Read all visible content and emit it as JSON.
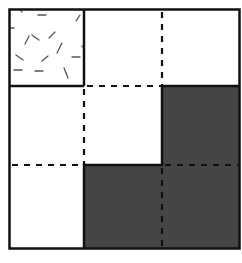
{
  "diagram": {
    "rows": 3,
    "cols": 3,
    "colors": {
      "background": "#ffffff",
      "line": "#111111",
      "shaded": "#454545",
      "texture": "#555555"
    },
    "cells": [
      {
        "row": 0,
        "col": 0,
        "fill": "textured"
      },
      {
        "row": 0,
        "col": 1,
        "fill": "white"
      },
      {
        "row": 0,
        "col": 2,
        "fill": "white"
      },
      {
        "row": 1,
        "col": 0,
        "fill": "white"
      },
      {
        "row": 1,
        "col": 1,
        "fill": "white"
      },
      {
        "row": 1,
        "col": 2,
        "fill": "shaded"
      },
      {
        "row": 2,
        "col": 0,
        "fill": "white"
      },
      {
        "row": 2,
        "col": 1,
        "fill": "shaded"
      },
      {
        "row": 2,
        "col": 2,
        "fill": "shaded"
      }
    ],
    "regions": [
      {
        "name": "textured-square",
        "cells": [
          [
            0,
            0
          ]
        ]
      },
      {
        "name": "white-region",
        "cells": [
          [
            0,
            1
          ],
          [
            0,
            2
          ],
          [
            1,
            0
          ],
          [
            1,
            1
          ],
          [
            2,
            0
          ]
        ]
      },
      {
        "name": "shaded-L-region",
        "cells": [
          [
            1,
            2
          ],
          [
            2,
            1
          ],
          [
            2,
            2
          ]
        ]
      }
    ]
  }
}
